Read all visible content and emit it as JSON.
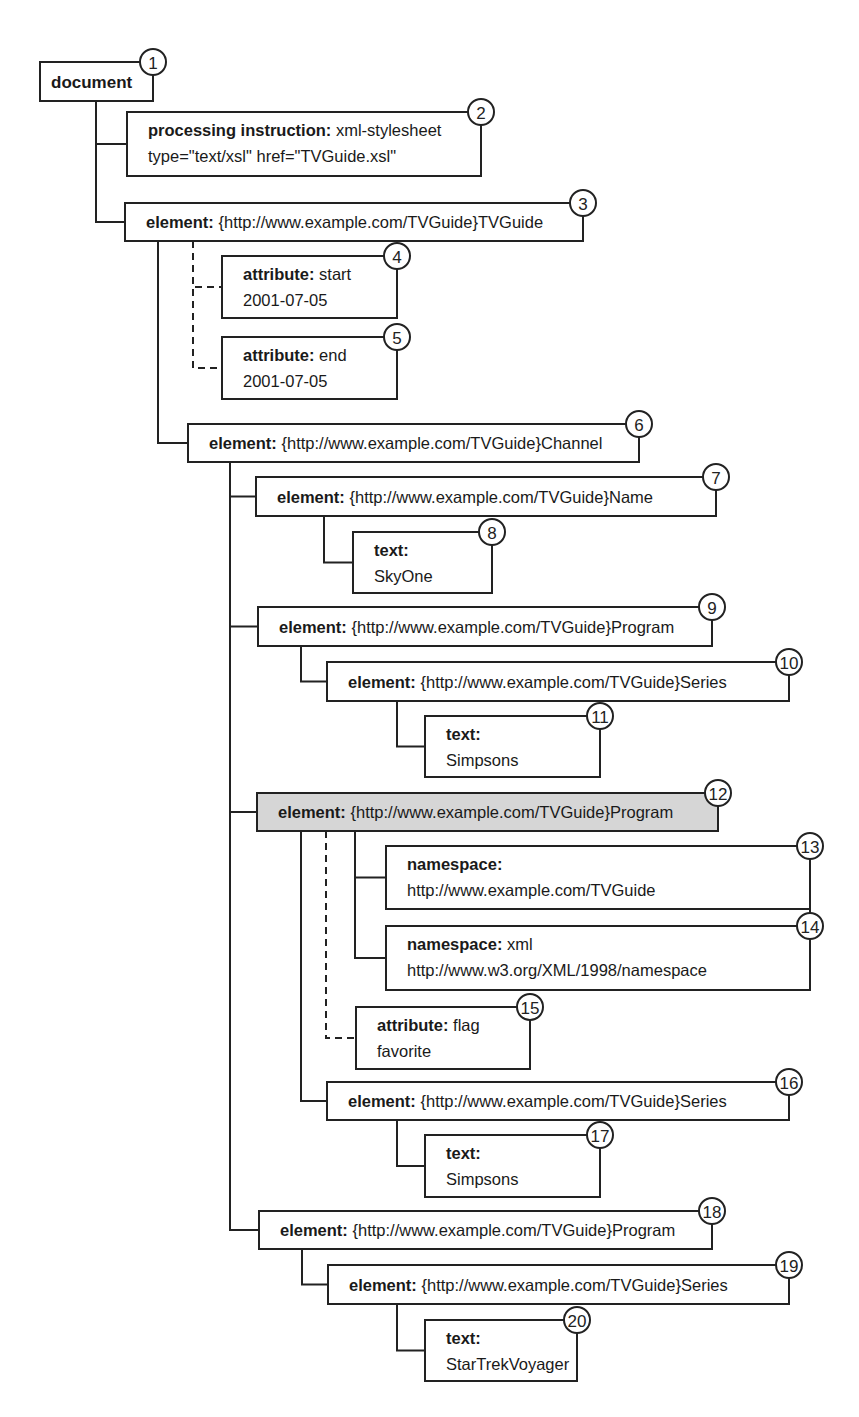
{
  "diagram": {
    "type": "xml-node-tree",
    "nodes": [
      {
        "num": "1",
        "kind": "document",
        "value": "",
        "line2": ""
      },
      {
        "num": "2",
        "kind": "processing instruction",
        "value": "xml-stylesheet",
        "line2": "type=\"text/xsl\" href=\"TVGuide.xsl\""
      },
      {
        "num": "3",
        "kind": "element",
        "value": "{http://www.example.com/TVGuide}TVGuide",
        "line2": ""
      },
      {
        "num": "4",
        "kind": "attribute",
        "value": "start",
        "line2": "2001-07-05"
      },
      {
        "num": "5",
        "kind": "attribute",
        "value": "end",
        "line2": "2001-07-05"
      },
      {
        "num": "6",
        "kind": "element",
        "value": "{http://www.example.com/TVGuide}Channel",
        "line2": ""
      },
      {
        "num": "7",
        "kind": "element",
        "value": "{http://www.example.com/TVGuide}Name",
        "line2": ""
      },
      {
        "num": "8",
        "kind": "text",
        "value": "",
        "line2": "SkyOne"
      },
      {
        "num": "9",
        "kind": "element",
        "value": "{http://www.example.com/TVGuide}Program",
        "line2": ""
      },
      {
        "num": "10",
        "kind": "element",
        "value": "{http://www.example.com/TVGuide}Series",
        "line2": ""
      },
      {
        "num": "11",
        "kind": "text",
        "value": "",
        "line2": "Simpsons"
      },
      {
        "num": "12",
        "kind": "element",
        "value": "{http://www.example.com/TVGuide}Program",
        "line2": "",
        "highlighted": true
      },
      {
        "num": "13",
        "kind": "namespace",
        "value": "",
        "line2": "http://www.example.com/TVGuide"
      },
      {
        "num": "14",
        "kind": "namespace",
        "value": "xml",
        "line2": "http://www.w3.org/XML/1998/namespace"
      },
      {
        "num": "15",
        "kind": "attribute",
        "value": "flag",
        "line2": "favorite"
      },
      {
        "num": "16",
        "kind": "element",
        "value": "{http://www.example.com/TVGuide}Series",
        "line2": ""
      },
      {
        "num": "17",
        "kind": "text",
        "value": "",
        "line2": "Simpsons"
      },
      {
        "num": "18",
        "kind": "element",
        "value": "{http://www.example.com/TVGuide}Program",
        "line2": ""
      },
      {
        "num": "19",
        "kind": "element",
        "value": "{http://www.example.com/TVGuide}Series",
        "line2": ""
      },
      {
        "num": "20",
        "kind": "text",
        "value": "",
        "line2": "StarTrekVoyager"
      }
    ],
    "edges": [
      {
        "from": "1",
        "to": "2",
        "style": "solid"
      },
      {
        "from": "1",
        "to": "3",
        "style": "solid"
      },
      {
        "from": "3",
        "to": "4",
        "style": "dashed"
      },
      {
        "from": "3",
        "to": "5",
        "style": "dashed"
      },
      {
        "from": "3",
        "to": "6",
        "style": "solid"
      },
      {
        "from": "6",
        "to": "7",
        "style": "solid"
      },
      {
        "from": "7",
        "to": "8",
        "style": "solid"
      },
      {
        "from": "6",
        "to": "9",
        "style": "solid"
      },
      {
        "from": "9",
        "to": "10",
        "style": "solid"
      },
      {
        "from": "10",
        "to": "11",
        "style": "solid"
      },
      {
        "from": "6",
        "to": "12",
        "style": "solid"
      },
      {
        "from": "12",
        "to": "13",
        "style": "solid"
      },
      {
        "from": "12",
        "to": "14",
        "style": "solid"
      },
      {
        "from": "12",
        "to": "15",
        "style": "dashed"
      },
      {
        "from": "12",
        "to": "16",
        "style": "solid"
      },
      {
        "from": "16",
        "to": "17",
        "style": "solid"
      },
      {
        "from": "6",
        "to": "18",
        "style": "solid"
      },
      {
        "from": "18",
        "to": "19",
        "style": "solid"
      },
      {
        "from": "19",
        "to": "20",
        "style": "solid"
      }
    ],
    "colors": {
      "line": "#222222",
      "highlight_fill": "#d6d6d6",
      "box_fill": "#ffffff"
    }
  }
}
